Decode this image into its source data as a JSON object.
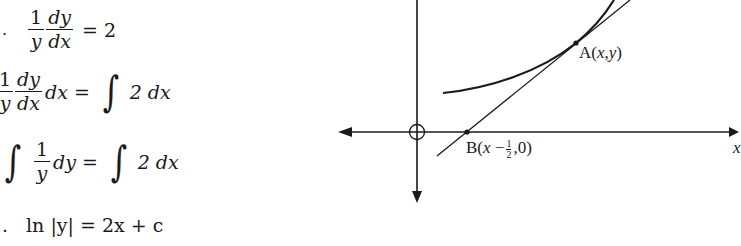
{
  "derivation": {
    "lines": [
      {
        "prefix": ".",
        "lhs_fraction_1": {
          "num": "1",
          "den": "y"
        },
        "lhs_fraction_2": {
          "num": "dy",
          "den": "dx"
        },
        "rhs": "= 2"
      },
      {
        "lhs_fraction_1": {
          "num": "1",
          "den": "y"
        },
        "lhs_fraction_2": {
          "num": "dy",
          "den": "dx"
        },
        "lhs_suffix": "dx =",
        "integral_sign": "∫",
        "rhs": "2 dx"
      },
      {
        "integral_sign": "∫",
        "lhs_fraction_1": {
          "num": "1",
          "den": "y"
        },
        "lhs_suffix": "dy =",
        "rhs_integral_sign": "∫",
        "rhs": "2 dx"
      },
      {
        "prefix": ".",
        "text": "ln |y| = 2x + c"
      }
    ]
  },
  "diagram": {
    "point_a_label": {
      "prefix": "A(",
      "x": "x",
      "comma": ",",
      "y": "y",
      "suffix": ")"
    },
    "point_b_label": {
      "prefix": "B(",
      "x": "x",
      "minus": " −",
      "frac_num": "1",
      "frac_den": "2",
      "suffix": ",0)"
    },
    "x_axis_label": "x",
    "origin_marker": "O"
  }
}
